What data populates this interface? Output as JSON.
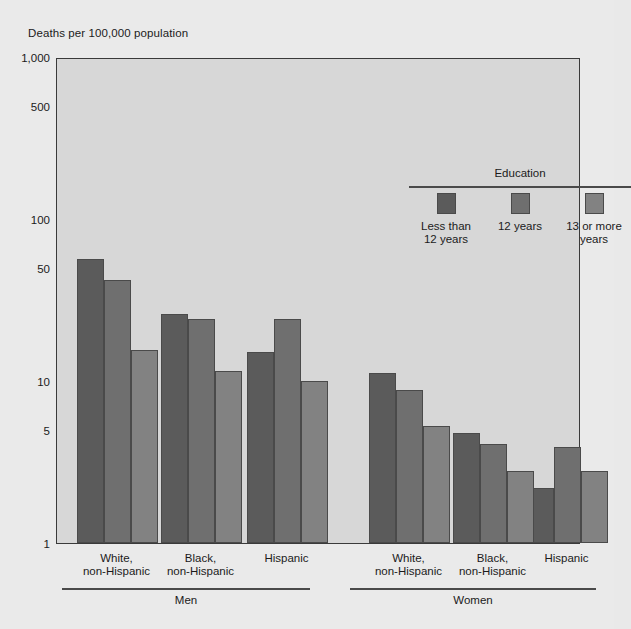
{
  "figure": {
    "axis_title": "Deaths per 100,000 population",
    "background_color": "#eaeaea",
    "plot_background_color": "#d7d7d7",
    "frame_color": "#3a3a3a"
  },
  "legend": {
    "title": "Education",
    "items": [
      {
        "label": "Less than\n12 years",
        "color": "#5b5b5b"
      },
      {
        "label": "12 years",
        "color": "#6f6f6f"
      },
      {
        "label": "13 or more\nyears",
        "color": "#828282"
      }
    ]
  },
  "chart_data": {
    "type": "bar",
    "title": "",
    "subtitle": "",
    "xlabel": "",
    "ylabel": "Deaths per 100,000 population",
    "yscale": "log",
    "ylim": [
      1,
      1000
    ],
    "yticks": [
      1,
      5,
      10,
      50,
      100,
      500,
      1000
    ],
    "ytick_labels": [
      "1",
      "5",
      "10",
      "50",
      "100",
      "500",
      "1,000"
    ],
    "grid": false,
    "legend_position": "upper right",
    "group_labels": [
      "Men",
      "Women"
    ],
    "categories": [
      "White,\nnon-Hispanic",
      "Black,\nnon-Hispanic",
      "Hispanic",
      "White,\nnon-Hispanic",
      "Black,\nnon-Hispanic",
      "Hispanic"
    ],
    "series": [
      {
        "name": "Less than 12 years",
        "color": "#5b5b5b",
        "values": [
          57,
          26,
          15,
          11.2,
          4.8,
          2.2
        ]
      },
      {
        "name": "12 years",
        "color": "#6f6f6f",
        "values": [
          42,
          24,
          24,
          8.8,
          4.1,
          3.9
        ]
      },
      {
        "name": "13 or more years",
        "color": "#828282",
        "values": [
          15.5,
          11.5,
          10,
          5.3,
          2.8,
          2.8
        ]
      }
    ]
  }
}
